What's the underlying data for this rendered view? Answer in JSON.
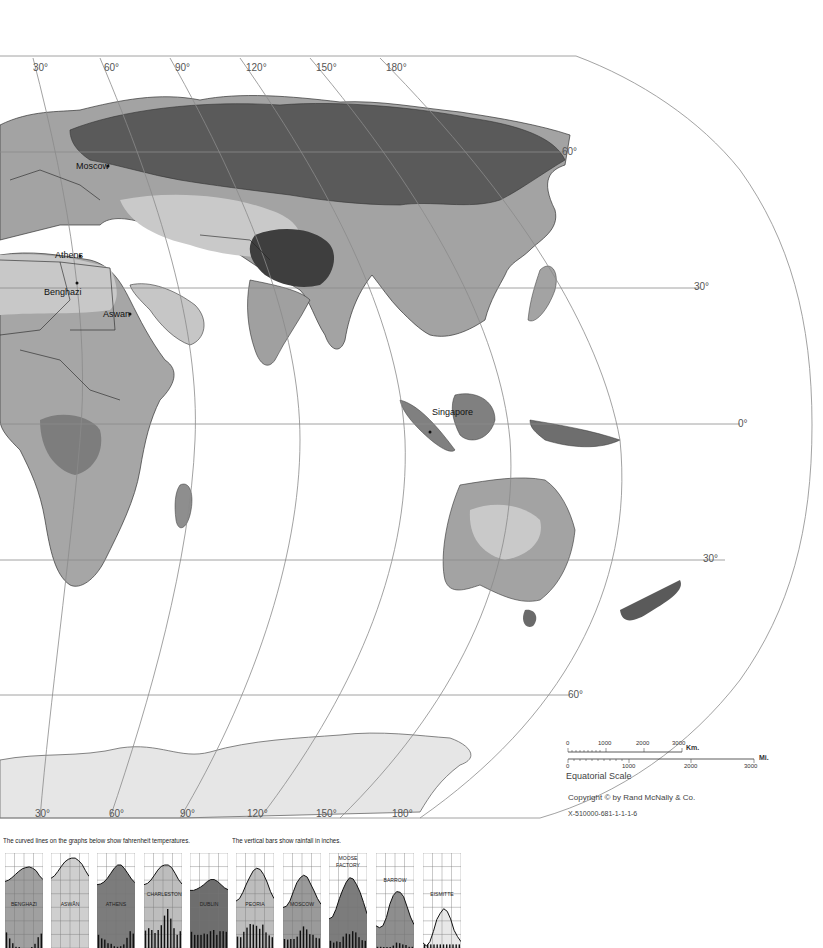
{
  "map": {
    "longitude_labels_top": [
      "30°",
      "60°",
      "90°",
      "120°",
      "150°",
      "180°"
    ],
    "longitude_labels_bottom": [
      "30°",
      "60°",
      "90°",
      "120°",
      "150°",
      "180°"
    ],
    "latitude_labels": [
      "60°",
      "30°",
      "0°",
      "30°",
      "60°"
    ],
    "cities": [
      "Moscow",
      "Athens",
      "Benghazi",
      "Aswan",
      "Singapore"
    ],
    "side_text": "Printed in U.S.A."
  },
  "scale": {
    "km_ticks": [
      "0",
      "1000",
      "2000",
      "3000"
    ],
    "km_unit": "Km.",
    "mi_ticks": [
      "0",
      "1000",
      "2000",
      "3000"
    ],
    "mi_unit": "Mi.",
    "caption": "Equatorial Scale"
  },
  "credits": {
    "copyright": "Copyright © by Rand McNally & Co.",
    "code": "X-510000-681-1-1-1-6"
  },
  "legend": {
    "temperature_note": "The curved lines on the graphs below show fahrenheit temperatures.",
    "rainfall_note": "The vertical bars show rainfall in inches."
  },
  "colors": {
    "land_light": "#c8c8c8",
    "land_mid": "#a3a3a3",
    "land_dark": "#7a7a7a",
    "land_darkest": "#4a4a4a",
    "ice": "#e6e6e6",
    "grid_line": "#8a8a8a"
  },
  "chart_data": [
    {
      "type": "area",
      "title": "BENGHAZI",
      "fill": "#a0a0a0",
      "temperature": [
        55,
        57,
        61,
        66,
        71,
        75,
        77,
        78,
        76,
        72,
        64,
        58
      ],
      "rainfall": [
        2.6,
        1.6,
        0.8,
        0.2,
        0.1,
        0,
        0,
        0,
        0.1,
        0.7,
        1.8,
        2.4
      ]
    },
    {
      "type": "area",
      "title": "ASWÂN",
      "fill": "#cfcfcf",
      "temperature": [
        60,
        64,
        71,
        79,
        86,
        90,
        92,
        92,
        88,
        82,
        72,
        63
      ],
      "rainfall": [
        0,
        0,
        0,
        0,
        0,
        0,
        0,
        0,
        0,
        0,
        0,
        0
      ]
    },
    {
      "type": "area",
      "title": "ATHENS",
      "fill": "#7c7c7c",
      "temperature": [
        50,
        51,
        54,
        60,
        68,
        76,
        81,
        81,
        75,
        67,
        59,
        53
      ],
      "rainfall": [
        2.2,
        1.6,
        1.4,
        0.8,
        0.7,
        0.3,
        0.2,
        0.3,
        0.6,
        1.7,
        2.8,
        2.4
      ]
    },
    {
      "type": "area",
      "title": "CHARLESTON",
      "fill": "#bdbdbd",
      "temperature": [
        50,
        52,
        57,
        65,
        73,
        79,
        81,
        81,
        77,
        68,
        58,
        51
      ],
      "rainfall": [
        2.9,
        3.3,
        3.0,
        2.5,
        3.0,
        3.8,
        5.4,
        6.5,
        4.9,
        3.3,
        2.2,
        2.8
      ]
    },
    {
      "type": "area",
      "title": "DUBLIN",
      "fill": "#6e6e6e",
      "temperature": [
        41,
        41,
        43,
        46,
        50,
        55,
        58,
        58,
        55,
        50,
        45,
        42
      ],
      "rainfall": [
        2.7,
        2.2,
        2.2,
        2.2,
        2.4,
        2.3,
        2.8,
        3.0,
        2.2,
        2.8,
        2.8,
        2.7
      ]
    },
    {
      "type": "area",
      "title": "PEORIA",
      "fill": "#bdbdbd",
      "temperature": [
        24,
        28,
        38,
        51,
        62,
        72,
        76,
        74,
        66,
        54,
        39,
        28
      ],
      "rainfall": [
        1.9,
        1.8,
        2.7,
        3.4,
        4.0,
        3.9,
        3.7,
        3.2,
        3.9,
        2.6,
        2.1,
        1.8
      ]
    },
    {
      "type": "area",
      "title": "MOSCOW",
      "fill": "#9a9a9a",
      "temperature": [
        14,
        16,
        24,
        39,
        53,
        61,
        65,
        62,
        51,
        40,
        28,
        19
      ],
      "rainfall": [
        1.5,
        1.4,
        1.5,
        1.5,
        1.9,
        2.9,
        3.6,
        3.1,
        2.3,
        2.2,
        1.7,
        1.6
      ]
    },
    {
      "type": "area",
      "title": "MOOSE FACTORY",
      "fill": "#7c7c7c",
      "temperature": [
        -4,
        -1,
        11,
        28,
        42,
        54,
        61,
        59,
        50,
        38,
        22,
        4
      ],
      "rainfall": [
        1.2,
        0.9,
        1.1,
        1.0,
        1.9,
        2.4,
        2.3,
        2.8,
        2.6,
        1.8,
        1.3,
        1.2
      ]
    },
    {
      "type": "area",
      "title": "BARROW",
      "fill": "#8e8e8e",
      "temperature": [
        -15,
        -18,
        -15,
        -2,
        19,
        33,
        39,
        38,
        31,
        15,
        -1,
        -13
      ],
      "rainfall": [
        0.2,
        0.2,
        0.1,
        0.1,
        0.1,
        0.4,
        0.9,
        0.8,
        0.6,
        0.5,
        0.2,
        0.2
      ]
    },
    {
      "type": "area",
      "title": "EISMITTE",
      "fill": "#e8e8e8",
      "temperature": [
        -42,
        -47,
        -40,
        -24,
        -5,
        5,
        12,
        8,
        -4,
        -22,
        -32,
        -40
      ],
      "rainfall": [
        0.6,
        0.6,
        0.6,
        0.6,
        0.6,
        0.6,
        0.6,
        0.6,
        0.6,
        0.6,
        0.6,
        0.6
      ]
    }
  ]
}
